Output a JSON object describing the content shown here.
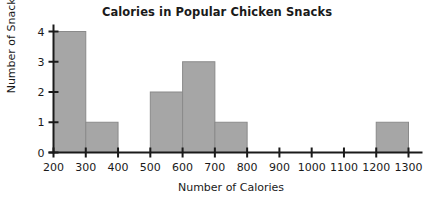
{
  "chart_data": {
    "type": "bar",
    "title": "Calories in Popular Chicken Snacks",
    "xlabel": "Number of Calories",
    "ylabel": "Number of Snacks",
    "xlim": [
      200,
      1300
    ],
    "ylim": [
      0,
      4
    ],
    "grid": false,
    "legend": null,
    "bin_width": 100,
    "x_tick_labels": [
      "200",
      "300",
      "400",
      "500",
      "600",
      "700",
      "800",
      "900",
      "1000",
      "1100",
      "1200",
      "1300"
    ],
    "x_tick_values": [
      200,
      300,
      400,
      500,
      600,
      700,
      800,
      900,
      1000,
      1100,
      1200,
      1300
    ],
    "y_tick_labels": [
      "0",
      "1",
      "2",
      "3",
      "4"
    ],
    "y_tick_values": [
      0,
      1,
      2,
      3,
      4
    ],
    "categories": [
      "200-300",
      "300-400",
      "400-500",
      "500-600",
      "600-700",
      "700-800",
      "800-900",
      "900-1000",
      "1000-1100",
      "1100-1200",
      "1200-1300"
    ],
    "bin_starts": [
      200,
      300,
      400,
      500,
      600,
      700,
      800,
      900,
      1000,
      1100,
      1200
    ],
    "values": [
      4,
      1,
      0,
      2,
      3,
      1,
      0,
      0,
      0,
      0,
      1
    ],
    "colors": {
      "bar_fill": "#a6a6a6",
      "bar_stroke": "#8a8a8a",
      "axis": "#1a1a1a",
      "text": "#1a1a1a",
      "background": "#ffffff"
    }
  }
}
